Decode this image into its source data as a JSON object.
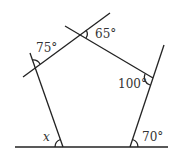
{
  "diagram": {
    "type": "pentagon-exterior-angles",
    "labels": {
      "top_left": "75°",
      "top": "65°",
      "right": "100°",
      "bottom_left": "x",
      "bottom_right": "70°"
    }
  }
}
